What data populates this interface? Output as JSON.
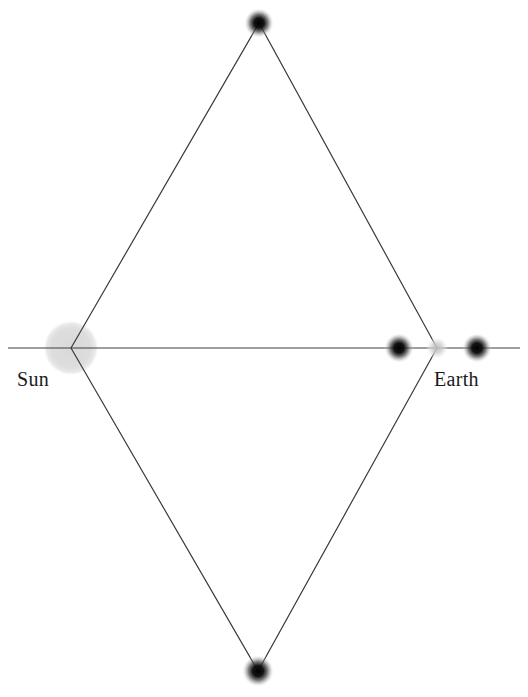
{
  "figure": {
    "kind": "astronomy-ray-diagram",
    "width": 528,
    "height": 697,
    "background_color": "#ffffff"
  },
  "labels": {
    "sun": "Sun",
    "earth": "Earth"
  },
  "colors": {
    "line": "#3a3a3a",
    "axis": "#3f3f3f",
    "sun_disk": "#dcdcdc",
    "dark_dot": "#111111",
    "light_dot": "#d2d2d2",
    "text": "#1a1a1a"
  },
  "geometry": {
    "axis": {
      "label": "sun-earth-axis",
      "x1": 8,
      "y1": 348,
      "x2": 520,
      "y2": 348,
      "stroke_width": 1.2
    },
    "diamond": {
      "label": "light-path-diamond",
      "stroke_width": 1.2,
      "vertices": [
        {
          "name": "sun-vertex",
          "x": 71,
          "y": 348
        },
        {
          "name": "top-vertex",
          "x": 259,
          "y": 23
        },
        {
          "name": "earth-vertex",
          "x": 437,
          "y": 348
        },
        {
          "name": "bottom-vertex",
          "x": 258,
          "y": 671
        }
      ]
    },
    "sun_disk": {
      "label": "sun-disk",
      "cx": 71,
      "cy": 348,
      "r": 27,
      "fill": "#dcdcdc"
    },
    "point_bodies": [
      {
        "name": "top-image-dot",
        "cx": 259,
        "cy": 23,
        "r": 7.0,
        "tone": "dark"
      },
      {
        "name": "bottom-image-dot",
        "cx": 258,
        "cy": 671,
        "r": 7.5,
        "tone": "dark"
      },
      {
        "name": "inner-dark-dot",
        "cx": 399,
        "cy": 348,
        "r": 7.0,
        "tone": "dark"
      },
      {
        "name": "earth-dot",
        "cx": 437,
        "cy": 348,
        "r": 6.5,
        "tone": "light"
      },
      {
        "name": "outer-dark-dot",
        "cx": 477,
        "cy": 348,
        "r": 7.0,
        "tone": "dark"
      }
    ]
  }
}
